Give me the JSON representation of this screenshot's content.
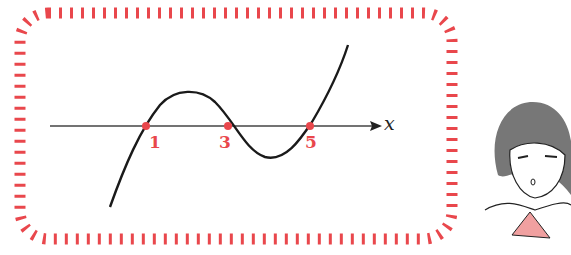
{
  "diagram": {
    "type": "cubic graph with roots marked",
    "axis_label": "x",
    "roots": [
      {
        "value": "1",
        "px": 146
      },
      {
        "value": "3",
        "px": 228
      },
      {
        "value": "5",
        "px": 310
      }
    ],
    "colors": {
      "frame": "#e9474c",
      "curve": "#1a1a1a",
      "axis": "#444444",
      "root_points": "#e9474c",
      "root_labels": "#e9474c",
      "scarf": "#f0a0a0"
    },
    "character": "girl-thinking"
  }
}
